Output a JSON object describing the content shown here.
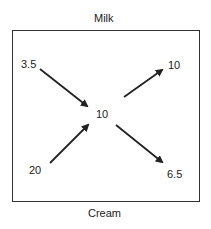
{
  "diagram": {
    "top_label": "Milk",
    "bottom_label": "Cream",
    "nodes": {
      "top_left": "3.5",
      "top_right": "10",
      "center": "10",
      "bottom_left": "20",
      "bottom_right": "6.5"
    },
    "arrows": [
      {
        "from": "top_left",
        "to": "center"
      },
      {
        "from": "bottom_left",
        "to": "center"
      },
      {
        "from": "center",
        "to": "top_right"
      },
      {
        "from": "center",
        "to": "bottom_right"
      }
    ],
    "colors": {
      "line": "#222222",
      "border": "#333333"
    }
  }
}
